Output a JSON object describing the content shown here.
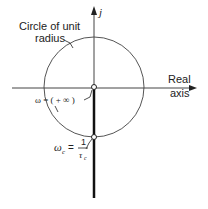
{
  "diagram": {
    "axes": {
      "vertical_label": "j",
      "horizontal_label_line1": "Real",
      "horizontal_label_line2": "axis"
    },
    "circle": {
      "label_line1": "Circle of unit",
      "label_line2": "radius"
    },
    "points": {
      "origin_label": "ω = ( + ∞ )",
      "cutoff_label_lhs": "ω",
      "cutoff_label_sub": "c",
      "cutoff_label_eq": "=",
      "cutoff_label_num": "1",
      "cutoff_label_den": "τ",
      "cutoff_label_den_sub": "c"
    },
    "colors": {
      "line": "#333333",
      "thick_line": "#111111",
      "background": "#ffffff"
    }
  }
}
